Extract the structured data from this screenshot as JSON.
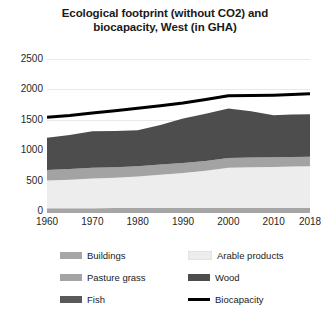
{
  "chart_data": {
    "type": "area",
    "title": "Ecological footprint (without CO2) and biocapacity, West (in GHA)",
    "title_line1": "Ecological footprint (without CO2) and",
    "title_line2": "biocapacity, West (in GHA)",
    "xlabel": "",
    "ylabel": "",
    "stacked": true,
    "grid": true,
    "legend_position": "bottom",
    "x": [
      1960,
      1965,
      1970,
      1975,
      1980,
      1985,
      1990,
      1995,
      2000,
      2005,
      2010,
      2014,
      2018
    ],
    "xtick_labels": [
      "1960",
      "1970",
      "1980",
      "1990",
      "2000",
      "2010",
      "2018"
    ],
    "xticks": [
      1960,
      1970,
      1980,
      1990,
      2000,
      2010,
      2018
    ],
    "ytick_labels": [
      "0",
      "500",
      "1000",
      "1500",
      "2000",
      "2500"
    ],
    "yticks": [
      0,
      500,
      1000,
      1500,
      2000,
      2500
    ],
    "ylim": [
      0,
      2500
    ],
    "xlim": [
      1960,
      2018
    ],
    "series": [
      {
        "name": "Buildings",
        "color": "#a6a6a6",
        "kind": "area",
        "values": [
          45,
          45,
          45,
          48,
          48,
          50,
          50,
          52,
          55,
          55,
          55,
          55,
          55
        ]
      },
      {
        "name": "Arable products",
        "color": "#ededed",
        "kind": "area",
        "values": [
          455,
          470,
          490,
          500,
          520,
          545,
          575,
          610,
          655,
          665,
          670,
          675,
          680
        ]
      },
      {
        "name": "Pasture grass",
        "color": "#a3a3a3",
        "kind": "area",
        "values": [
          175,
          175,
          175,
          172,
          170,
          168,
          165,
          162,
          160,
          160,
          160,
          158,
          158
        ]
      },
      {
        "name": "Wood",
        "color": "#4d4d4d",
        "kind": "area",
        "values": [
          530,
          560,
          600,
          595,
          590,
          650,
          730,
          775,
          815,
          760,
          690,
          700,
          700
        ]
      },
      {
        "name": "Fish",
        "color": "#595959",
        "kind": "area",
        "values": [
          0,
          0,
          0,
          0,
          0,
          0,
          0,
          0,
          0,
          0,
          0,
          0,
          0
        ]
      },
      {
        "name": "Biocapacity",
        "color": "#000000",
        "kind": "line",
        "values": [
          1540,
          1570,
          1610,
          1650,
          1690,
          1730,
          1775,
          1835,
          1895,
          1900,
          1905,
          1915,
          1930
        ]
      }
    ],
    "totals_footprint": [
      1205,
      1250,
      1310,
      1315,
      1328,
      1413,
      1520,
      1599,
      1685,
      1640,
      1575,
      1588,
      1593
    ]
  },
  "legend": {
    "items": [
      {
        "label": "Buildings",
        "color": "#a6a6a6",
        "type": "swatch"
      },
      {
        "label": "Arable products",
        "color": "#ededed",
        "type": "swatch"
      },
      {
        "label": "Pasture grass",
        "color": "#a3a3a3",
        "type": "swatch"
      },
      {
        "label": "Wood",
        "color": "#4d4d4d",
        "type": "swatch"
      },
      {
        "label": "Fish",
        "color": "#595959",
        "type": "swatch"
      },
      {
        "label": "Biocapacity",
        "color": "#000000",
        "type": "line"
      }
    ]
  }
}
